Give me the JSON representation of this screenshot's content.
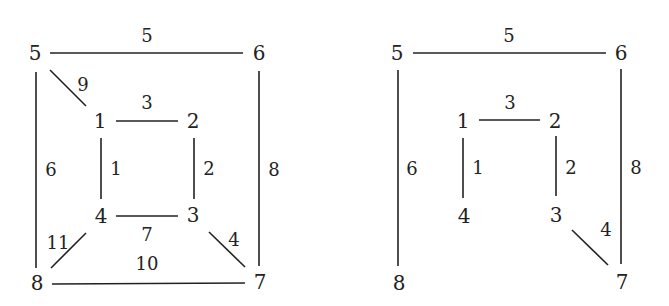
{
  "graphs": [
    {
      "name": "original-graph",
      "nodes": [
        {
          "id": "5",
          "x": 35,
          "y": 54
        },
        {
          "id": "6",
          "x": 259,
          "y": 54
        },
        {
          "id": "1",
          "x": 100,
          "y": 122
        },
        {
          "id": "2",
          "x": 193,
          "y": 122
        },
        {
          "id": "4",
          "x": 101,
          "y": 217
        },
        {
          "id": "3",
          "x": 193,
          "y": 216
        },
        {
          "id": "8",
          "x": 37,
          "y": 284
        },
        {
          "id": "7",
          "x": 260,
          "y": 283
        }
      ],
      "edges": [
        {
          "from": "5",
          "to": "6",
          "weight": "5",
          "x1": 50,
          "y1": 53,
          "x2": 243,
          "y2": 53,
          "lx": 147,
          "ly": 37
        },
        {
          "from": "5",
          "to": "1",
          "weight": "9",
          "x1": 50,
          "y1": 70,
          "x2": 86,
          "y2": 106,
          "lx": 83,
          "ly": 86
        },
        {
          "from": "1",
          "to": "2",
          "weight": "3",
          "x1": 116,
          "y1": 121,
          "x2": 178,
          "y2": 121,
          "lx": 147,
          "ly": 104
        },
        {
          "from": "5",
          "to": "8",
          "weight": "6",
          "x1": 36,
          "y1": 72,
          "x2": 36,
          "y2": 268,
          "lx": 51,
          "ly": 171
        },
        {
          "from": "1",
          "to": "4",
          "weight": "1",
          "x1": 101,
          "y1": 138,
          "x2": 101,
          "y2": 199,
          "lx": 116,
          "ly": 170
        },
        {
          "from": "2",
          "to": "3",
          "weight": "2",
          "x1": 194,
          "y1": 138,
          "x2": 194,
          "y2": 199,
          "lx": 209,
          "ly": 170
        },
        {
          "from": "6",
          "to": "7",
          "weight": "8",
          "x1": 259,
          "y1": 71,
          "x2": 259,
          "y2": 266,
          "lx": 274,
          "ly": 171
        },
        {
          "from": "4",
          "to": "3",
          "weight": "7",
          "x1": 116,
          "y1": 216,
          "x2": 178,
          "y2": 216,
          "lx": 147,
          "ly": 236
        },
        {
          "from": "4",
          "to": "8",
          "weight": "11",
          "x1": 86,
          "y1": 233,
          "x2": 51,
          "y2": 268,
          "lx": 58,
          "ly": 244
        },
        {
          "from": "3",
          "to": "7",
          "weight": "4",
          "x1": 209,
          "y1": 232,
          "x2": 245,
          "y2": 267,
          "lx": 234,
          "ly": 241
        },
        {
          "from": "8",
          "to": "7",
          "weight": "10",
          "x1": 52,
          "y1": 284,
          "x2": 245,
          "y2": 283,
          "lx": 147,
          "ly": 265
        }
      ]
    },
    {
      "name": "spanning-tree",
      "nodes": [
        {
          "id": "5",
          "x": 397,
          "y": 54
        },
        {
          "id": "6",
          "x": 621,
          "y": 54
        },
        {
          "id": "1",
          "x": 463,
          "y": 122
        },
        {
          "id": "2",
          "x": 555,
          "y": 122
        },
        {
          "id": "4",
          "x": 464,
          "y": 217
        },
        {
          "id": "3",
          "x": 556,
          "y": 216
        },
        {
          "id": "8",
          "x": 399,
          "y": 284
        },
        {
          "id": "7",
          "x": 622,
          "y": 283
        }
      ],
      "edges": [
        {
          "from": "5",
          "to": "6",
          "weight": "5",
          "x1": 413,
          "y1": 53,
          "x2": 606,
          "y2": 53,
          "lx": 509,
          "ly": 37
        },
        {
          "from": "1",
          "to": "2",
          "weight": "3",
          "x1": 479,
          "y1": 120,
          "x2": 540,
          "y2": 120,
          "lx": 510,
          "ly": 104
        },
        {
          "from": "5",
          "to": "8",
          "weight": "6",
          "x1": 398,
          "y1": 70,
          "x2": 398,
          "y2": 266,
          "lx": 412,
          "ly": 170
        },
        {
          "from": "1",
          "to": "4",
          "weight": "1",
          "x1": 463,
          "y1": 138,
          "x2": 463,
          "y2": 198,
          "lx": 478,
          "ly": 169
        },
        {
          "from": "2",
          "to": "3",
          "weight": "2",
          "x1": 556,
          "y1": 136,
          "x2": 556,
          "y2": 196,
          "lx": 571,
          "ly": 169
        },
        {
          "from": "6",
          "to": "7",
          "weight": "8",
          "x1": 621,
          "y1": 69,
          "x2": 621,
          "y2": 264,
          "lx": 636,
          "ly": 169
        },
        {
          "from": "3",
          "to": "7",
          "weight": "4",
          "x1": 572,
          "y1": 230,
          "x2": 608,
          "y2": 265,
          "lx": 606,
          "ly": 231
        }
      ]
    }
  ]
}
